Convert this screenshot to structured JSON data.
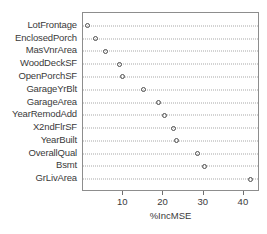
{
  "chart_data": {
    "type": "scatter",
    "title": "",
    "xlabel": "%IncMSE",
    "ylabel": "",
    "xlim": [
      0,
      44
    ],
    "ylim": [
      0,
      14
    ],
    "grid": true,
    "grid_style": "dotted-horizontal",
    "legend": "none",
    "marker": "open-circle",
    "orientation": "horizontal",
    "xticks": [
      10,
      20,
      30,
      40
    ],
    "xtick_labels": [
      "10",
      "20",
      "30",
      "40"
    ],
    "categories": [
      "GrLivArea",
      "Bsmt",
      "OverallQual",
      "YearBuilt",
      "X2ndFlrSF",
      "YearRemodAdd",
      "GarageArea",
      "GarageYrBlt",
      "OpenPorchSF",
      "WoodDeckSF",
      "MasVnrArea",
      "EnclosedPorch",
      "LotFrontage"
    ],
    "values": [
      41.7,
      30.2,
      28.4,
      23.2,
      22.5,
      20.2,
      18.7,
      15.0,
      9.7,
      9.0,
      5.5,
      3.0,
      1.0
    ],
    "points": [
      {
        "label": "GrLivArea",
        "value": 41.7
      },
      {
        "label": "Bsmt",
        "value": 30.2
      },
      {
        "label": "OverallQual",
        "value": 28.4
      },
      {
        "label": "YearBuilt",
        "value": 23.2
      },
      {
        "label": "X2ndFlrSF",
        "value": 22.5
      },
      {
        "label": "YearRemodAdd",
        "value": 20.2
      },
      {
        "label": "GarageArea",
        "value": 18.7
      },
      {
        "label": "GarageYrBlt",
        "value": 15.0
      },
      {
        "label": "OpenPorchSF",
        "value": 9.7
      },
      {
        "label": "WoodDeckSF",
        "value": 9.0
      },
      {
        "label": "MasVnrArea",
        "value": 5.5
      },
      {
        "label": "EnclosedPorch",
        "value": 3.0
      },
      {
        "label": "LotFrontage",
        "value": 1.0
      }
    ],
    "colors": {
      "marker_stroke": "#4f4f4f",
      "grid": "#a8a8a8",
      "panel_border": "#8d8d8d",
      "text": "#3a3a3a",
      "background": "#ffffff"
    }
  }
}
